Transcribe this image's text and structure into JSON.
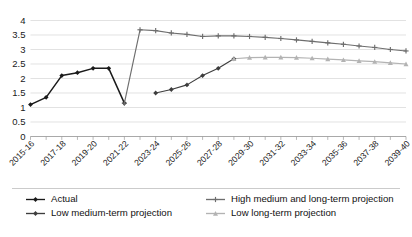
{
  "chart_data": {
    "type": "line",
    "title": "",
    "subtitle": "",
    "xlabel": "",
    "ylabel": "",
    "ylim": [
      0,
      4
    ],
    "ytick_values": [
      0,
      0.5,
      1,
      1.5,
      2,
      2.5,
      3,
      3.5,
      4
    ],
    "ytick_labels": [
      "0",
      "0.5",
      "1",
      "1.5",
      "2",
      "2.5",
      "3",
      "3.5",
      "4"
    ],
    "grid": true,
    "legend_position": "bottom",
    "x": [
      "2015-16",
      "2016-17",
      "2017-18",
      "2018-19",
      "2019-20",
      "2020-21",
      "2021-22",
      "2022-23",
      "2023-24",
      "2024-25",
      "2025-26",
      "2026-27",
      "2027-28",
      "2028-29",
      "2029-30",
      "2030-31",
      "2031-32",
      "2032-33",
      "2033-34",
      "2034-35",
      "2035-36",
      "2036-37",
      "2037-38",
      "2038-39",
      "2039-40"
    ],
    "xtick_labels_shown": [
      "2015-16",
      "2017-18",
      "2019-20",
      "2021-22",
      "2023-24",
      "2025-26",
      "2027-28",
      "2029-30",
      "2031-32",
      "2033-34",
      "2035-36",
      "2037-38",
      "2039-40"
    ],
    "series": [
      {
        "name": "Actual",
        "color": "#1a1a1a",
        "marker": "diamond",
        "values": [
          1.1,
          1.35,
          2.1,
          2.2,
          2.35,
          2.35,
          1.15,
          null,
          null,
          null,
          null,
          null,
          null,
          null,
          null,
          null,
          null,
          null,
          null,
          null,
          null,
          null,
          null,
          null,
          null
        ]
      },
      {
        "name": "Low medium-term projection",
        "color": "#3d3d3d",
        "marker": "diamond",
        "values": [
          null,
          null,
          null,
          null,
          null,
          null,
          null,
          null,
          1.5,
          1.62,
          1.78,
          2.1,
          2.35,
          2.68,
          null,
          null,
          null,
          null,
          null,
          null,
          null,
          null,
          null,
          null,
          null
        ]
      },
      {
        "name": "High medium and long-term projection",
        "color": "#6e6e6e",
        "marker": "plus",
        "values": [
          null,
          null,
          null,
          null,
          null,
          null,
          1.15,
          3.68,
          3.65,
          3.57,
          3.52,
          3.45,
          3.47,
          3.47,
          3.45,
          3.42,
          3.38,
          3.33,
          3.28,
          3.23,
          3.18,
          3.12,
          3.07,
          3.0,
          2.95
        ]
      },
      {
        "name": "Low long-term projection",
        "color": "#b3b3b3",
        "marker": "triangle",
        "values": [
          null,
          null,
          null,
          null,
          null,
          null,
          null,
          null,
          null,
          null,
          null,
          null,
          null,
          2.68,
          2.72,
          2.73,
          2.73,
          2.72,
          2.7,
          2.67,
          2.64,
          2.61,
          2.58,
          2.54,
          2.5
        ]
      }
    ],
    "legend": [
      {
        "label": "Actual",
        "color": "#1a1a1a",
        "marker": "diamond"
      },
      {
        "label": "High medium and long-term projection",
        "color": "#6e6e6e",
        "marker": "plus"
      },
      {
        "label": "Low medium-term projection",
        "color": "#3d3d3d",
        "marker": "diamond"
      },
      {
        "label": "Low long-term projection",
        "color": "#b3b3b3",
        "marker": "triangle"
      }
    ]
  }
}
